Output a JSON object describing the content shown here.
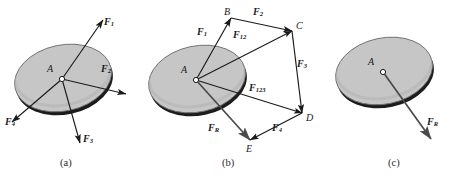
{
  "figure": {
    "width": 455,
    "height": 189,
    "background": "#ffffff"
  },
  "colors": {
    "disk_fill": "#c6c6c6",
    "disk_edge": "#6e6e6e",
    "disk_shadow": "#1c1c1c",
    "vector_stroke": "#1a1a1a",
    "resultant_stroke": "#4a4a4a",
    "text": "#1a1a1a",
    "caption_text": "#2b2b2b",
    "hub_fill": "#ffffff"
  },
  "panels": [
    {
      "id": "a",
      "caption": "(a)",
      "caption_x": 60,
      "caption_y": 164,
      "disk": {
        "cx": 63,
        "cy": 78,
        "rx": 49,
        "ry": 33,
        "rotate": -12
      },
      "origin": {
        "x": 62,
        "y": 79,
        "label": "A",
        "label_x": 47,
        "label_y": 69
      },
      "vectors": [
        {
          "name": "F1",
          "label": "F",
          "sub": "1",
          "x2": 103,
          "y2": 20,
          "label_x": 104,
          "label_y": 22
        },
        {
          "name": "F2",
          "label": "F",
          "sub": "2",
          "x2": 126,
          "y2": 94,
          "label_x": 101,
          "label_y": 69
        },
        {
          "name": "F3",
          "label": "F",
          "sub": "3",
          "x2": 80,
          "y2": 143,
          "label_x": 83,
          "label_y": 139
        },
        {
          "name": "F4",
          "label": "F",
          "sub": "4",
          "x2": 12,
          "y2": 122,
          "label_x": 5,
          "label_y": 122
        }
      ]
    },
    {
      "id": "b",
      "caption": "(b)",
      "caption_x": 222,
      "caption_y": 164,
      "disk": {
        "cx": 197,
        "cy": 79,
        "rx": 49,
        "ry": 33,
        "rotate": -12
      },
      "origin": {
        "x": 196,
        "y": 80,
        "label": "A",
        "label_x": 181,
        "label_y": 70
      },
      "points": [
        {
          "name": "B",
          "x": 231,
          "y": 18,
          "label_x": 224,
          "label_y": 13
        },
        {
          "name": "C",
          "x": 292,
          "y": 31,
          "label_x": 296,
          "label_y": 27
        },
        {
          "name": "D",
          "x": 302,
          "y": 113,
          "label_x": 306,
          "label_y": 119
        },
        {
          "name": "E",
          "x": 250,
          "y": 140,
          "label_x": 246,
          "label_y": 150
        }
      ],
      "edges": [
        {
          "name": "AB",
          "label": "F",
          "sub": "1",
          "from": "A",
          "to": "B",
          "label_x": 197,
          "label_y": 32
        },
        {
          "name": "BC",
          "label": "F",
          "sub": "2",
          "from": "B",
          "to": "C",
          "label_x": 253,
          "label_y": 13
        },
        {
          "name": "CD",
          "label": "F",
          "sub": "3",
          "from": "C",
          "to": "D",
          "label_x": 297,
          "label_y": 64
        },
        {
          "name": "DE",
          "label": "F",
          "sub": "4",
          "from": "D",
          "to": "E",
          "label_x": 272,
          "label_y": 128
        },
        {
          "name": "AC",
          "label": "F",
          "sub": "12",
          "from": "A",
          "to": "C",
          "label_x": 233,
          "label_y": 35
        },
        {
          "name": "AD",
          "label": "F",
          "sub": "123",
          "from": "A",
          "to": "D",
          "label_x": 249,
          "label_y": 88
        },
        {
          "name": "AE",
          "label": "F",
          "sub": "R",
          "from": "A",
          "to": "E",
          "label_x": 208,
          "label_y": 128
        }
      ]
    },
    {
      "id": "c",
      "caption": "(c)",
      "caption_x": 388,
      "caption_y": 164,
      "disk": {
        "cx": 384,
        "cy": 71,
        "rx": 49,
        "ry": 33,
        "rotate": -12
      },
      "origin": {
        "x": 383,
        "y": 72,
        "label": "A",
        "label_x": 368,
        "label_y": 62
      },
      "vectors": [
        {
          "name": "FR",
          "label": "F",
          "sub": "R",
          "x2": 431,
          "y2": 139,
          "label_x": 427,
          "label_y": 122
        }
      ]
    }
  ]
}
